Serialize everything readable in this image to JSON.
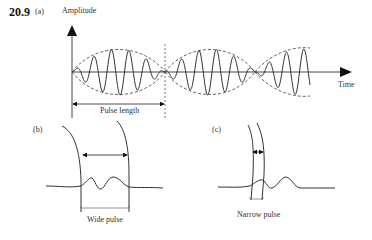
{
  "figure": {
    "number": "20.9",
    "panels": {
      "a": {
        "label": "(a)",
        "y_axis_label": "Amplitude",
        "x_axis_label": "Time",
        "annotation": "Pulse length"
      },
      "b": {
        "label": "(b)",
        "annotation": "Wide pulse"
      },
      "c": {
        "label": "(c)",
        "annotation": "Narrow pulse"
      }
    }
  }
}
